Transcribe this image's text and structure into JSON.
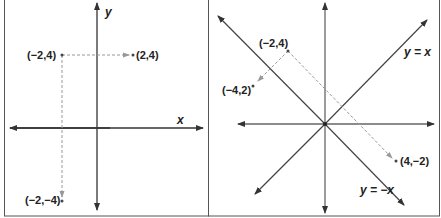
{
  "panels": [
    {
      "name": "reflection-over-x-axis",
      "axis_labels": {
        "x": "x",
        "y": "y"
      },
      "points": [
        {
          "label": "(−2,4)",
          "x": -2,
          "y": 4
        },
        {
          "label": "(2,4)",
          "x": 2,
          "y": 4
        },
        {
          "label": "(−2,−4)",
          "x": -2,
          "y": -4
        }
      ],
      "arrows": [
        {
          "from": "(−2,4)",
          "to": "(2,4)"
        },
        {
          "from": "(−2,4)",
          "to": "(−2,−4)"
        }
      ]
    },
    {
      "name": "reflection-over-diagonals",
      "line_labels": {
        "pos": "y = x",
        "neg": "y = −x"
      },
      "points": [
        {
          "label": "(−2,4)",
          "x": -2,
          "y": 4
        },
        {
          "label": "(−4,2)",
          "x": -4,
          "y": 2
        },
        {
          "label": "(4,−2)",
          "x": 4,
          "y": -2
        }
      ],
      "arrows": [
        {
          "from": "(−2,4)",
          "to": "(−4,2)"
        },
        {
          "from": "(−2,4)",
          "to": "(4,−2)"
        }
      ]
    }
  ],
  "colors": {
    "axis": "#333333",
    "dashed": "#999999",
    "border": "#555555"
  }
}
